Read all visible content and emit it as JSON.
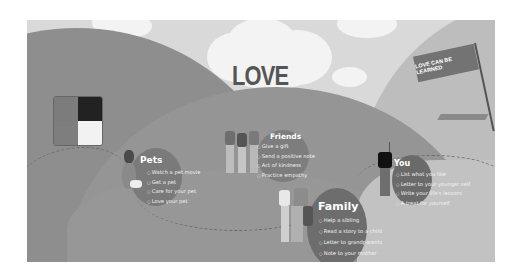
{
  "title": "LOVE",
  "flag_text": "LOVE CAN BE LEARNED",
  "sections": {
    "pets": {
      "label": "Pets",
      "items": [
        "Watch a pet movie",
        "Get a pet",
        "Care for your pet",
        "Love your pet"
      ]
    },
    "friends": {
      "label": "Friends",
      "items": [
        "Give a gift",
        "Send a positive note",
        "Act of kindness",
        "Practice empathy"
      ]
    },
    "family": {
      "label": "Family",
      "items": [
        "Help a sibling",
        "Read a story to a child",
        "Letter to grandparents",
        "Note to your mother"
      ]
    },
    "you": {
      "label": "You",
      "items": [
        "List what you like",
        "Letter to your younger self",
        "Write your life's lessons",
        "A treat for yourself"
      ]
    }
  },
  "colors": {
    "sky": "#d9d9d9",
    "cloud": "#f3f3f3",
    "hill_dark": "#8e8e8e",
    "hill_mid": "#959595",
    "hill_light": "#bdbdbd",
    "title": "#555555",
    "text": "#ffffff"
  }
}
